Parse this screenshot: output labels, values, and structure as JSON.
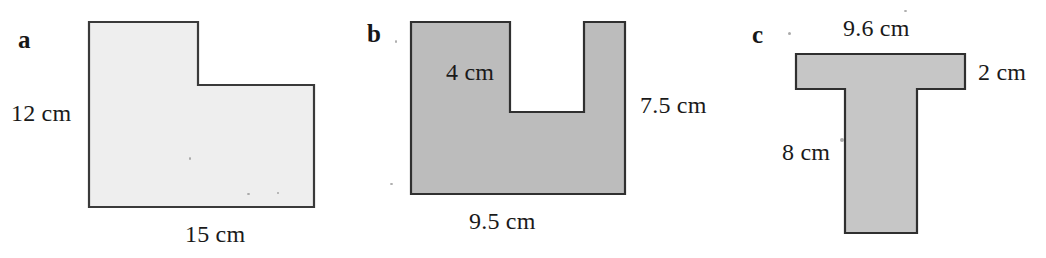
{
  "figure": {
    "background_color": "#ffffff",
    "outline_color": "#3a3a3a",
    "parts": [
      {
        "letter": "a",
        "fill_color": "#eeeeee",
        "shape": "L-shape",
        "labels": [
          {
            "name": "height",
            "value": "12",
            "unit": "cm",
            "text": "12 cm"
          },
          {
            "name": "width",
            "value": "15",
            "unit": "cm",
            "text": "15 cm"
          }
        ]
      },
      {
        "letter": "b",
        "fill_color": "#bcbcbc",
        "shape": "U-shape",
        "labels": [
          {
            "name": "notch-depth",
            "value": "4",
            "unit": "cm",
            "text": "4 cm"
          },
          {
            "name": "height",
            "value": "7.5",
            "unit": "cm",
            "text": "7.5 cm"
          },
          {
            "name": "width",
            "value": "9.5",
            "unit": "cm",
            "text": "9.5 cm"
          }
        ]
      },
      {
        "letter": "c",
        "fill_color": "#c6c6c6",
        "shape": "T-shape",
        "labels": [
          {
            "name": "top-width",
            "value": "9.6",
            "unit": "cm",
            "text": "9.6 cm"
          },
          {
            "name": "top-thickness",
            "value": "2",
            "unit": "cm",
            "text": "2 cm"
          },
          {
            "name": "height",
            "value": "8",
            "unit": "cm",
            "text": "8 cm"
          }
        ]
      }
    ]
  }
}
